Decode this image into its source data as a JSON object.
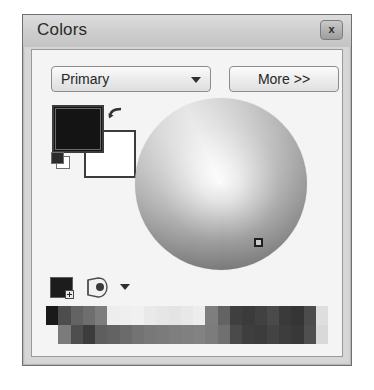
{
  "window": {
    "title": "Colors",
    "close_label": "x",
    "close_icon": "close-icon"
  },
  "toolbar": {
    "mode_selected": "Primary",
    "mode_options": [
      "Primary",
      "Secondary"
    ],
    "mode_arrow_icon": "chevron-down-icon",
    "more_label": "More >>"
  },
  "swatches": {
    "primary_color": "#141414",
    "secondary_color": "#ffffff",
    "swap_icon": "swap-arrow-icon",
    "reset_icon": "reset-colors-icon"
  },
  "color_wheel": {
    "cursor_icon": "color-wheel-cursor",
    "cursor_x": 119,
    "cursor_y": 140
  },
  "palette_toolbar": {
    "add_color_icon": "add-color-icon",
    "palette_icon": "palette-icon",
    "palette_menu_arrow_icon": "chevron-down-icon"
  },
  "palette": {
    "rows": [
      [
        "#1a1a1a",
        "#4d4d4d",
        "#636363",
        "#6e6e6e",
        "#7d7d7d",
        "#ededed",
        "#efefef",
        "#f0f0f0",
        "#e9e9e9",
        "#e6e6e6",
        "#e4e4e4",
        "#e8e8e8",
        "#ededed",
        "#7e7e7e",
        "#636363",
        "#3f3f3f",
        "#3b3b3b",
        "#414141",
        "#4a4a4a",
        "#3a3a3a",
        "#353535",
        "#4c4c4c",
        "#dedede"
      ],
      [
        "#f4f4f4",
        "#7b7b7b",
        "#4e4e4e",
        "#3c3c3c",
        "#5e5e5e",
        "#636363",
        "#6b6b6b",
        "#737373",
        "#787878",
        "#7b7b7b",
        "#7e7e7e",
        "#808080",
        "#828282",
        "#7c7c7c",
        "#707070",
        "#4a4a4a",
        "#3e3e3e",
        "#3c3c3c",
        "#434343",
        "#3d3d3d",
        "#383838",
        "#4f4f4f",
        "#d9d9d9"
      ]
    ]
  }
}
